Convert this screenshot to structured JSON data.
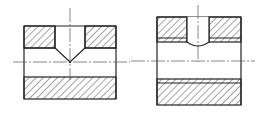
{
  "diagram": {
    "type": "mechanical-section-drawing",
    "views": [
      {
        "id": "left",
        "description": "Section with drilled blind hole, conical (118° drill point) bottom reaching the bore centerline"
      },
      {
        "id": "right",
        "description": "Section with drilled hole terminating in shallow rounded bottom above bore"
      }
    ],
    "colors": {
      "line": "#222222",
      "hatch": "#333333",
      "background": "#ffffff"
    }
  }
}
